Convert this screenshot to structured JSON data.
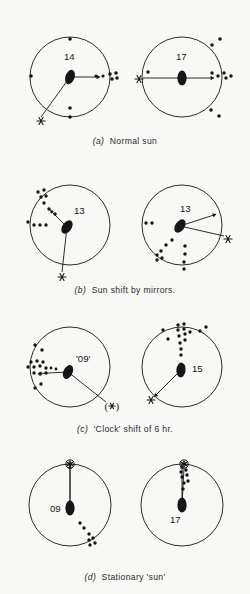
{
  "figure": {
    "background_color": "#f8f8f6",
    "ink_color": "#161616",
    "width": 250,
    "height": 594
  },
  "panels": [
    {
      "id": "a",
      "caption_label": "(a)",
      "caption_text": "Normal sun",
      "caption_y": 136,
      "circles": [
        {
          "name": "panel-a-left",
          "cx": 70,
          "cy": 77,
          "r": 40,
          "heading_label": "14",
          "heading_label_x": 64,
          "heading_label_y": 60,
          "lens_cx": 70,
          "lens_cy": 77,
          "lens_angle": 20,
          "vector_angle_deg": 0,
          "vector_length": 30,
          "sun_symbol": "asterisk",
          "sun_label": "*",
          "sun_x": 41,
          "sun_y": 121,
          "sun_line_to_x": 41,
          "sun_line_to_y": 117,
          "dots": [
            {
              "x": 96,
              "y": 76,
              "r": 1.6
            },
            {
              "x": 103,
              "y": 76,
              "r": 1.6
            },
            {
              "x": 110,
              "y": 74,
              "r": 1.8
            },
            {
              "x": 112,
              "y": 79,
              "r": 1.8
            },
            {
              "x": 116,
              "y": 73,
              "r": 1.8
            },
            {
              "x": 117,
              "y": 78,
              "r": 1.8
            },
            {
              "x": 70,
              "y": 39,
              "r": 1.8
            },
            {
              "x": 31,
              "y": 76,
              "r": 1.8
            },
            {
              "x": 70,
              "y": 108,
              "r": 1.8
            },
            {
              "x": 70,
              "y": 117,
              "r": 1.8
            }
          ]
        },
        {
          "name": "panel-a-right",
          "cx": 182,
          "cy": 77,
          "r": 40,
          "heading_label": "17",
          "heading_label_x": 176,
          "heading_label_y": 60,
          "lens_cx": 182,
          "lens_cy": 78,
          "lens_angle": 0,
          "vector_angle_deg": 0,
          "vector_length": 32,
          "sun_symbol": "asterisk",
          "sun_label": "*",
          "sun_x": 139,
          "sun_y": 79,
          "sun_line_to_x": 143,
          "sun_line_to_y": 78,
          "dots": [
            {
              "x": 212,
              "y": 73,
              "r": 1.7
            },
            {
              "x": 218,
              "y": 76,
              "r": 1.7
            },
            {
              "x": 224,
              "y": 73,
              "r": 1.7
            },
            {
              "x": 226,
              "y": 78,
              "r": 1.7
            },
            {
              "x": 231,
              "y": 76,
              "r": 1.7
            },
            {
              "x": 148,
              "y": 72,
              "r": 1.7
            },
            {
              "x": 212,
              "y": 45,
              "r": 1.8
            },
            {
              "x": 220,
              "y": 39,
              "r": 1.8
            },
            {
              "x": 211,
              "y": 110,
              "r": 1.8
            },
            {
              "x": 219,
              "y": 116,
              "r": 1.8
            }
          ]
        }
      ]
    },
    {
      "id": "b",
      "caption_label": "(b)",
      "caption_text": "Sun shift by mirrors.",
      "caption_y": 285,
      "circles": [
        {
          "name": "panel-b-left",
          "cx": 70,
          "cy": 225,
          "r": 40,
          "heading_label": "13",
          "heading_label_x": 74,
          "heading_label_y": 214,
          "lens_cx": 67,
          "lens_cy": 227,
          "lens_angle": 35,
          "vector_angle_deg": 135,
          "vector_length": 24,
          "sun_symbol": "asterisk",
          "sun_label": "*",
          "sun_x": 62,
          "sun_y": 277,
          "sun_line_to_x": 62,
          "sun_line_to_y": 272,
          "dots": [
            {
              "x": 55,
              "y": 214,
              "r": 1.7
            },
            {
              "x": 49,
              "y": 209,
              "r": 1.7
            },
            {
              "x": 44,
              "y": 203,
              "r": 1.7
            },
            {
              "x": 41,
              "y": 197,
              "r": 1.7
            },
            {
              "x": 46,
              "y": 196,
              "r": 1.7
            },
            {
              "x": 38,
              "y": 192,
              "r": 1.7
            },
            {
              "x": 44,
              "y": 190,
              "r": 1.7
            },
            {
              "x": 34,
              "y": 225,
              "r": 1.7
            },
            {
              "x": 40,
              "y": 225,
              "r": 1.7
            },
            {
              "x": 46,
              "y": 225,
              "r": 1.7
            },
            {
              "x": 28,
              "y": 222,
              "r": 1.7
            }
          ]
        },
        {
          "name": "panel-b-right",
          "cx": 182,
          "cy": 225,
          "r": 40,
          "heading_label": "13",
          "heading_label_x": 180,
          "heading_label_y": 212,
          "lens_cx": 180,
          "lens_cy": 226,
          "lens_angle": 35,
          "vector_angle_deg": 18,
          "vector_length": 38,
          "sun_symbol": "asterisk",
          "sun_label": "*",
          "sun_x": 228,
          "sun_y": 239,
          "sun_line_to_x": 224,
          "sun_line_to_y": 236,
          "dots": [
            {
              "x": 172,
              "y": 240,
              "r": 1.7
            },
            {
              "x": 166,
              "y": 245,
              "r": 1.7
            },
            {
              "x": 161,
              "y": 251,
              "r": 1.7
            },
            {
              "x": 157,
              "y": 255,
              "r": 1.7
            },
            {
              "x": 157,
              "y": 260,
              "r": 1.7
            },
            {
              "x": 162,
              "y": 258,
              "r": 1.7
            },
            {
              "x": 185,
              "y": 246,
              "r": 1.7
            },
            {
              "x": 185,
              "y": 254,
              "r": 1.7
            },
            {
              "x": 184,
              "y": 262,
              "r": 1.7
            },
            {
              "x": 184,
              "y": 269,
              "r": 1.7
            },
            {
              "x": 146,
              "y": 223,
              "r": 1.7
            },
            {
              "x": 152,
              "y": 223,
              "r": 1.7
            }
          ]
        }
      ]
    },
    {
      "id": "c",
      "caption_label": "(c)",
      "caption_text": "'Clock' shift of 6 hr.",
      "caption_y": 424,
      "circles": [
        {
          "name": "panel-c-left",
          "cx": 70,
          "cy": 367,
          "r": 40,
          "heading_label": "'09'",
          "heading_label_x": 76,
          "heading_label_y": 362,
          "lens_cx": 68,
          "lens_cy": 372,
          "lens_angle": 25,
          "vector_angle_deg": 183,
          "vector_length": 30,
          "sun_symbol": "asterisk-paren",
          "sun_label": "(*)",
          "sun_x": 112,
          "sun_y": 406,
          "sun_line_to_x": 106,
          "sun_line_to_y": 402,
          "dots": [
            {
              "x": 46,
              "y": 368,
              "r": 1.7
            },
            {
              "x": 40,
              "y": 366,
              "r": 1.7
            },
            {
              "x": 34,
              "y": 367,
              "r": 1.7
            },
            {
              "x": 28,
              "y": 367,
              "r": 1.7
            },
            {
              "x": 31,
              "y": 362,
              "r": 1.7
            },
            {
              "x": 37,
              "y": 361,
              "r": 1.7
            },
            {
              "x": 43,
              "y": 362,
              "r": 1.7
            },
            {
              "x": 34,
              "y": 373,
              "r": 1.7
            },
            {
              "x": 40,
              "y": 374,
              "r": 1.7
            },
            {
              "x": 46,
              "y": 373,
              "r": 1.7
            },
            {
              "x": 51,
              "y": 368,
              "r": 1.4
            },
            {
              "x": 56,
              "y": 369,
              "r": 1.4
            },
            {
              "x": 35,
              "y": 345,
              "r": 1.7
            },
            {
              "x": 42,
              "y": 350,
              "r": 1.7
            },
            {
              "x": 35,
              "y": 388,
              "r": 1.7
            },
            {
              "x": 41,
              "y": 384,
              "r": 1.7
            }
          ]
        },
        {
          "name": "panel-c-right",
          "cx": 182,
          "cy": 367,
          "r": 40,
          "heading_label": "15",
          "heading_label_x": 192,
          "heading_label_y": 372,
          "lens_cx": 181,
          "lens_cy": 370,
          "lens_angle": 5,
          "vector_angle_deg": 225,
          "vector_length": 38,
          "sun_symbol": "asterisk",
          "sun_label": "*",
          "sun_x": 151,
          "sun_y": 400,
          "sun_line_to_x": 155,
          "sun_line_to_y": 396,
          "dots": [
            {
              "x": 181,
              "y": 355,
              "r": 1.7
            },
            {
              "x": 181,
              "y": 349,
              "r": 1.7
            },
            {
              "x": 180,
              "y": 343,
              "r": 1.7
            },
            {
              "x": 185,
              "y": 340,
              "r": 1.7
            },
            {
              "x": 179,
              "y": 336,
              "r": 1.7
            },
            {
              "x": 185,
              "y": 334,
              "r": 1.7
            },
            {
              "x": 178,
              "y": 330,
              "r": 1.7
            },
            {
              "x": 184,
              "y": 329,
              "r": 1.7
            },
            {
              "x": 190,
              "y": 332,
              "r": 1.7
            },
            {
              "x": 178,
              "y": 325,
              "r": 1.7
            },
            {
              "x": 184,
              "y": 324,
              "r": 1.7
            },
            {
              "x": 163,
              "y": 330,
              "r": 1.7
            },
            {
              "x": 200,
              "y": 331,
              "r": 1.7
            },
            {
              "x": 206,
              "y": 327,
              "r": 1.7
            },
            {
              "x": 168,
              "y": 339,
              "r": 1.7
            }
          ]
        }
      ]
    },
    {
      "id": "d",
      "caption_label": "(d)",
      "caption_text": "Stationary 'sun'",
      "caption_y": 572,
      "circles": [
        {
          "name": "panel-d-left",
          "cx": 70,
          "cy": 505,
          "r": 41,
          "heading_label": "09",
          "heading_label_x": 50,
          "heading_label_y": 512,
          "lens_cx": 70,
          "lens_cy": 508,
          "lens_angle": 0,
          "vector_angle_deg": 90,
          "vector_length": 43,
          "sun_symbol": "asterisk-circled",
          "sun_label": "*",
          "sun_x": 70,
          "sun_y": 464,
          "sun_line_to_x": 70,
          "sun_line_to_y": 468,
          "dots": [
            {
              "x": 80,
              "y": 523,
              "r": 1.7
            },
            {
              "x": 84,
              "y": 528,
              "r": 1.7
            },
            {
              "x": 89,
              "y": 534,
              "r": 1.7
            },
            {
              "x": 93,
              "y": 538,
              "r": 1.7
            },
            {
              "x": 89,
              "y": 540,
              "r": 1.7
            },
            {
              "x": 95,
              "y": 543,
              "r": 1.7
            },
            {
              "x": 90,
              "y": 545,
              "r": 1.7
            }
          ]
        },
        {
          "name": "panel-d-right",
          "cx": 182,
          "cy": 505,
          "r": 41,
          "heading_label": "17",
          "heading_label_x": 170,
          "heading_label_y": 523,
          "lens_cx": 182,
          "lens_cy": 505,
          "lens_angle": 0,
          "vector_angle_deg": 90,
          "vector_length": 40,
          "sun_symbol": "asterisk-circled",
          "sun_label": "*",
          "sun_x": 184,
          "sun_y": 464,
          "sun_line_to_x": 184,
          "sun_line_to_y": 468,
          "dots": [
            {
              "x": 183,
              "y": 489,
              "r": 1.7
            },
            {
              "x": 184,
              "y": 483,
              "r": 1.7
            },
            {
              "x": 188,
              "y": 481,
              "r": 1.7
            },
            {
              "x": 182,
              "y": 477,
              "r": 1.7
            },
            {
              "x": 187,
              "y": 475,
              "r": 1.7
            },
            {
              "x": 181,
              "y": 472,
              "r": 1.7
            },
            {
              "x": 186,
              "y": 470,
              "r": 1.7
            }
          ]
        }
      ]
    }
  ]
}
